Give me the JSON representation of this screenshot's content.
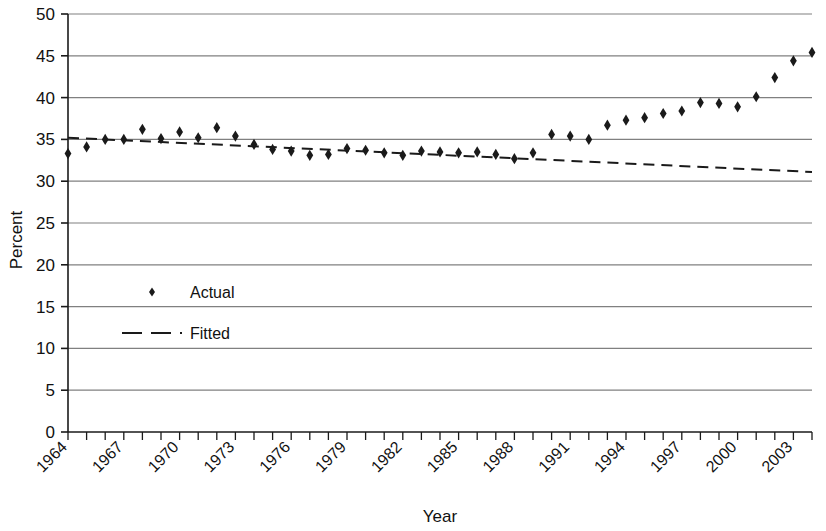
{
  "chart_data": {
    "type": "scatter",
    "title": "",
    "xlabel": "Year",
    "ylabel": "Percent",
    "xlim": [
      1964,
      2004
    ],
    "ylim": [
      0,
      50
    ],
    "ytick_step": 5,
    "yticks": [
      0,
      5,
      10,
      15,
      20,
      25,
      30,
      35,
      40,
      45,
      50
    ],
    "xticks": [
      1964,
      1965,
      1966,
      1967,
      1968,
      1969,
      1970,
      1971,
      1972,
      1973,
      1974,
      1975,
      1976,
      1977,
      1978,
      1979,
      1980,
      1981,
      1982,
      1983,
      1984,
      1985,
      1986,
      1987,
      1988,
      1989,
      1990,
      1991,
      1992,
      1993,
      1994,
      1995,
      1996,
      1997,
      1998,
      1999,
      2000,
      2001,
      2002,
      2003,
      2004
    ],
    "xtick_labels": [
      "1964",
      "",
      "",
      "1967",
      "",
      "",
      "1970",
      "",
      "",
      "1973",
      "",
      "",
      "1976",
      "",
      "",
      "1979",
      "",
      "",
      "1982",
      "",
      "",
      "1985",
      "",
      "",
      "1988",
      "",
      "",
      "1991",
      "",
      "",
      "1994",
      "",
      "",
      "1997",
      "",
      "",
      "2000",
      "",
      "",
      "2003",
      ""
    ],
    "xtick_labels_shown": [
      "1964",
      "1967",
      "1970",
      "1973",
      "1976",
      "1979",
      "1982",
      "1985",
      "1988",
      "1991",
      "1994",
      "1997",
      "2000",
      "2003"
    ],
    "grid": "horizontal",
    "legend_position": "inside-left",
    "marker_color": "#1a1a1a",
    "line_color": "#1a1a1a",
    "grid_color": "#808080",
    "axis_color": "#1a1a1a",
    "series": [
      {
        "name": "Actual",
        "marker": "diamond",
        "x": [
          1964,
          1965,
          1966,
          1967,
          1968,
          1969,
          1970,
          1971,
          1972,
          1973,
          1974,
          1975,
          1976,
          1977,
          1978,
          1979,
          1980,
          1981,
          1982,
          1983,
          1984,
          1985,
          1986,
          1987,
          1988,
          1989,
          1990,
          1991,
          1992,
          1993,
          1994,
          1995,
          1996,
          1997,
          1998,
          1999,
          2000,
          2001,
          2002,
          2003,
          2004
        ],
        "values": [
          33.3,
          34.1,
          35.0,
          35.0,
          36.2,
          35.1,
          35.9,
          35.2,
          36.4,
          35.4,
          34.4,
          33.8,
          33.6,
          33.1,
          33.2,
          33.9,
          33.7,
          33.4,
          33.1,
          33.6,
          33.5,
          33.4,
          33.5,
          33.2,
          32.7,
          33.4,
          35.6,
          35.4,
          35.0,
          36.7,
          37.3,
          37.6,
          38.1,
          38.4,
          39.4,
          39.3,
          38.9,
          40.1,
          42.4,
          44.4,
          45.4
        ]
      },
      {
        "name": "Fitted",
        "marker": "dashed-line",
        "x": [
          1964,
          2004
        ],
        "values": [
          35.2,
          31.1
        ]
      }
    ]
  },
  "legend": {
    "items": [
      {
        "label": "Actual",
        "symbol": "diamond"
      },
      {
        "label": "Fitted",
        "symbol": "dashed-line"
      }
    ]
  }
}
